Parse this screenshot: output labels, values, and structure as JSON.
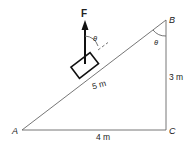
{
  "diagram": {
    "vertices": {
      "A": {
        "label": "A",
        "x": 22,
        "y": 130
      },
      "B": {
        "label": "B",
        "x": 166,
        "y": 20
      },
      "C": {
        "label": "C",
        "x": 166,
        "y": 130
      }
    },
    "sides": {
      "hypotenuse": {
        "label": "5 m"
      },
      "vertical": {
        "label": "3 m"
      },
      "base": {
        "label": "4 m"
      }
    },
    "force": {
      "label": "F"
    },
    "angles": {
      "at_force": {
        "label": "θ"
      },
      "at_B": {
        "label": "θ"
      }
    },
    "colors": {
      "line": "#555555",
      "thick": "#111111",
      "text": "#222222"
    }
  }
}
